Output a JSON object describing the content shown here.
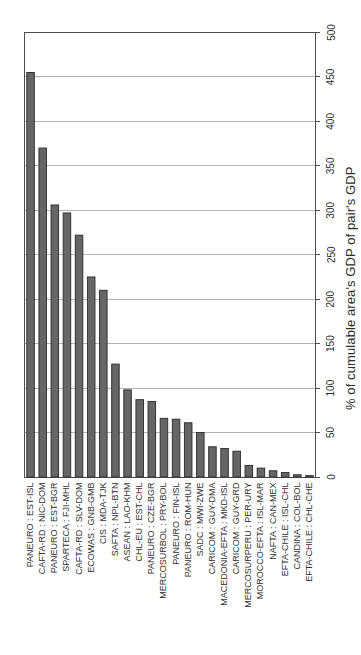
{
  "chart_data": {
    "type": "bar",
    "title": "",
    "xlabel": "",
    "ylabel": "% of cumulable area's GDP of pair's GDP",
    "ylim": [
      0,
      500
    ],
    "yticks": [
      0,
      50,
      100,
      150,
      200,
      250,
      300,
      350,
      400,
      450,
      500
    ],
    "grid": true,
    "legend": false,
    "value_axis_side": "right",
    "label_rotation_degrees": -90,
    "categories": [
      "PANEURO : EST-ISL",
      "CAFTA-RD : NIC-DOM",
      "PANEURO : EST-BGR",
      "SPARTECA : FJI-MHL",
      "CAFTA-RD : SLV-DOM",
      "ECOWAS : GNB-GMB",
      "CIS : MDA-TJK",
      "SAFTA : NPL-BTN",
      "ASEAN : LAO-KHM",
      "CHL-EU : EST-CHL",
      "PANEURO : CZE-BGR",
      "MERCOSURBOL : PRY-BOL",
      "PANEURO : FIN-ISL",
      "PANEURO : ROM-HUN",
      "SADC : MWI-ZWE",
      "CARICOM : GUY-DMA",
      "MACEDONIA-EFTA : MKD-ISL",
      "CARICOM : GUY-GRD",
      "MERCOSURPERU : PER-URY",
      "MOROCCO-EFTA : ISL-MAR",
      "NAFTA : CAN-MEX",
      "EFTA-CHILE : ISL-CHL",
      "CANDINA : COL-BOL",
      "EFTA-CHILE : CHL-CHE"
    ],
    "values": [
      455,
      370,
      306,
      297,
      272,
      225,
      210,
      127,
      98,
      87,
      85,
      66,
      65,
      61,
      50,
      34,
      32,
      29,
      13,
      10,
      7,
      5,
      2.5,
      1.5
    ],
    "colors": {
      "bar": "#666666",
      "bar_edge": "#333333",
      "gridline": "#b3b3b3",
      "axis": "#4d4d4d",
      "text": "#2e2e2e",
      "background": "#ffffff"
    }
  }
}
